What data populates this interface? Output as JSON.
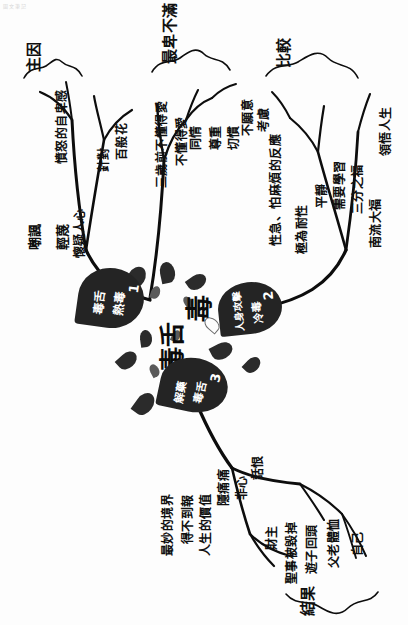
{
  "document": {
    "title": "毒舌",
    "watermark": "圖文筆記",
    "orientation": "rotated-90",
    "medium": "hand-drawn ink mind map"
  },
  "center": {
    "main_word": "毒",
    "sub_word": "毒舌"
  },
  "nodes": [
    {
      "number": "1",
      "line1": "熱毒",
      "line2": "毒舌"
    },
    {
      "number": "2",
      "line1": "冷毒",
      "line2": "人身攻擊"
    },
    {
      "number": "3",
      "line1": "毒舌",
      "line2": "解藥"
    }
  ],
  "branches": [
    {
      "id": "branch-main-cause",
      "heading": "主因",
      "items": [
        "嘲諷",
        "輕蔑",
        "懷疑人心",
        "憤怒的自卑感",
        "針對",
        "百般花"
      ]
    },
    {
      "id": "branch-discontent",
      "heading": "最卑不滿",
      "items": [
        "三歲前不懂得愛",
        "不懂得愛",
        "同情",
        "尊重",
        "切慣",
        "不願意",
        "考慮"
      ]
    },
    {
      "id": "branch-comparison",
      "heading": "比較",
      "items": [
        "性急、怕麻煩的反應",
        "極為耐性",
        "平靜",
        "需要學習",
        "三分之福",
        "南流大福",
        "領悟人生"
      ]
    },
    {
      "id": "branch-result",
      "heading": "結果",
      "items": [
        "最妙的境界",
        "得不到報",
        "人生的價值",
        "隱痛痛",
        "非心",
        "財主",
        "聖事被毀掉",
        "遊子回頭",
        "父老體恤",
        "自己",
        "話恨"
      ]
    }
  ],
  "colors": {
    "ink": "#0d0d0d",
    "node_fill": "#242424",
    "drop_fill": "#5a5a5a",
    "paper": "#fdfdfd"
  }
}
